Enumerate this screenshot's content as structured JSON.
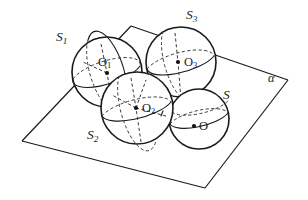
{
  "figure": {
    "background_color": "#ffffff",
    "stroke_color": "#1a1a1a",
    "dashed_color": "#3a3a3a",
    "width": 308,
    "height": 200
  },
  "plane": {
    "name_label": "α",
    "label_x": 268,
    "label_y": 72,
    "vertices": [
      {
        "x": 22,
        "y": 141
      },
      {
        "x": 131,
        "y": 26
      },
      {
        "x": 288,
        "y": 80
      },
      {
        "x": 205,
        "y": 188
      }
    ]
  },
  "spheres": [
    {
      "id": "S1",
      "label": "S",
      "sub": "1",
      "label_x": 56,
      "label_y": 30,
      "cx": 107,
      "cy": 72,
      "r": 35,
      "center_label": "O",
      "center_sub": "1",
      "center_label_x": 98,
      "center_label_y": 56,
      "dot_x": 107,
      "dot_y": 73
    },
    {
      "id": "S3",
      "label": "S",
      "sub": "3",
      "label_x": 186,
      "label_y": 8,
      "cx": 181,
      "cy": 62,
      "r": 35,
      "center_label": "O",
      "center_sub": "3",
      "center_label_x": 184,
      "center_label_y": 56,
      "dot_x": 178,
      "dot_y": 62
    },
    {
      "id": "S2",
      "label": "S",
      "sub": "2",
      "label_x": 87,
      "label_y": 128,
      "cx": 137,
      "cy": 108,
      "r": 36,
      "center_label": "O",
      "center_sub": "2",
      "center_label_x": 142,
      "center_label_y": 102,
      "dot_x": 136,
      "dot_y": 108
    },
    {
      "id": "S",
      "label": "S",
      "sub": "",
      "label_x": 223,
      "label_y": 88,
      "cx": 199,
      "cy": 119,
      "r": 30,
      "center_label": "O",
      "center_sub": "",
      "center_label_x": 199,
      "center_label_y": 120,
      "dot_x": 194,
      "dot_y": 126
    }
  ],
  "annotations": {
    "sphere_labels": [
      "S1",
      "S3",
      "S2",
      "S"
    ],
    "center_labels": [
      "O1",
      "O3",
      "O2",
      "O"
    ],
    "plane_label": "α"
  }
}
